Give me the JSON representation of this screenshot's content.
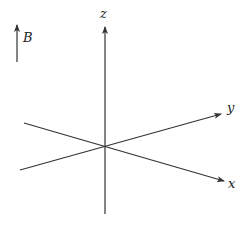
{
  "diagram": {
    "field_label": "B",
    "axes": {
      "x": "x",
      "y": "y",
      "z": "z"
    },
    "line_color": "#333333"
  }
}
